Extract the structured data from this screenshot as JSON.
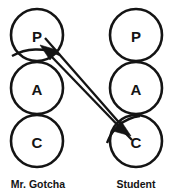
{
  "diagram": {
    "type": "transactional-analysis-pac",
    "stroke_color": "#141414",
    "fill_color": "#ffffff",
    "background_color": "#ffffff",
    "columns": [
      {
        "key": "left",
        "label": "Mr. Gotcha",
        "label_x": 38,
        "label_y": 187,
        "center_x": 37,
        "circles": [
          {
            "letter": "P",
            "name": "parent",
            "cx": 37,
            "cy": 35,
            "r": 26
          },
          {
            "letter": "A",
            "name": "adult",
            "cx": 37,
            "cy": 88,
            "r": 26
          },
          {
            "letter": "C",
            "name": "child",
            "cx": 37,
            "cy": 141,
            "r": 26
          }
        ]
      },
      {
        "key": "right",
        "label": "Student",
        "label_x": 136,
        "label_y": 187,
        "center_x": 136,
        "circles": [
          {
            "letter": "P",
            "name": "parent",
            "cx": 136,
            "cy": 35,
            "r": 26
          },
          {
            "letter": "A",
            "name": "adult",
            "cx": 136,
            "cy": 88,
            "r": 26
          },
          {
            "letter": "C",
            "name": "child",
            "cx": 136,
            "cy": 141,
            "r": 26
          }
        ]
      }
    ],
    "vectors": [
      {
        "name": "student-child-to-gotcha-parent",
        "direction": "up-left",
        "from": {
          "x": 129,
          "y": 137
        },
        "to": {
          "x": 41,
          "y": 46
        },
        "head_points": "41,46 56,50 50,58",
        "line": "M 131,139 L 50,55"
      },
      {
        "name": "gotcha-parent-to-student-child",
        "direction": "down-right",
        "from": {
          "x": 47,
          "y": 41
        },
        "to": {
          "x": 130,
          "y": 134
        },
        "head_points": "130,134 114,130 121,122",
        "line": "M 45,39 L 121,125"
      }
    ],
    "crossbar": {
      "name": "gotcha-parent-crossbar",
      "path": "M 13,55 C 26,48 42,46 58,53"
    }
  }
}
